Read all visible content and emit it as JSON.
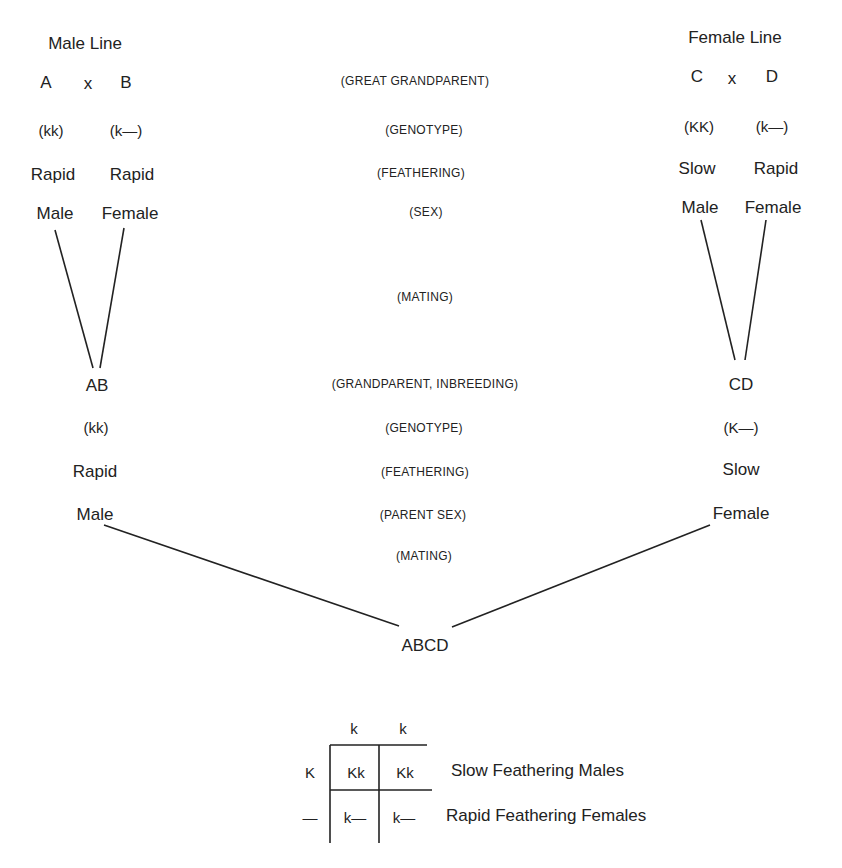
{
  "male_line": {
    "title": "Male Line",
    "parents": [
      {
        "name": "A",
        "genotype": "(kk)",
        "feathering": "Rapid",
        "sex": "Male"
      },
      {
        "name": "B",
        "genotype": "(k—)",
        "feathering": "Rapid",
        "sex": "Female"
      }
    ],
    "cross": "x",
    "offspring": {
      "name": "AB",
      "genotype": "(kk)",
      "feathering": "Rapid",
      "sex": "Male"
    }
  },
  "female_line": {
    "title": "Female Line",
    "parents": [
      {
        "name": "C",
        "genotype": "(KK)",
        "feathering": "Slow",
        "sex": "Male"
      },
      {
        "name": "D",
        "genotype": "(k—)",
        "feathering": "Rapid",
        "sex": "Female"
      }
    ],
    "cross": "x",
    "offspring": {
      "name": "CD",
      "genotype": "(K—)",
      "feathering": "Slow",
      "sex": "Female"
    }
  },
  "center_labels": {
    "great_grandparent": "(GREAT GRANDPARENT)",
    "genotype1": "(GENOTYPE)",
    "feathering1": "(FEATHERING)",
    "sex": "(SEX)",
    "mating1": "(MATING)",
    "grandparent": "(GRANDPARENT, INBREEDING)",
    "genotype2": "(GENOTYPE)",
    "feathering2": "(FEATHERING)",
    "parent_sex": "(PARENT SEX)",
    "mating2": "(MATING)"
  },
  "final_cross": "ABCD",
  "punnett": {
    "col_headers": [
      "k",
      "k"
    ],
    "row_headers": [
      "K",
      "—"
    ],
    "cells": [
      [
        "Kk",
        "Kk"
      ],
      [
        "k—",
        "k—"
      ]
    ],
    "row_legends": [
      "Slow Feathering Males",
      "Rapid Feathering Females"
    ]
  }
}
